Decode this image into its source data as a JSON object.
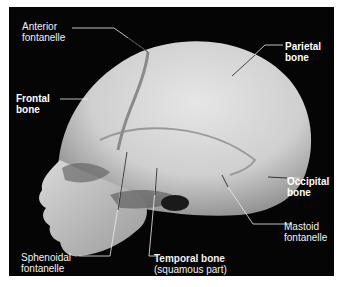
{
  "figure": {
    "background_color": "#050505",
    "bone_color": "#d8d8d8",
    "label_color": "#ffffff"
  },
  "labels": {
    "anterior_fontanelle": {
      "line1": "Anterior",
      "line2": "fontanelle"
    },
    "frontal_bone": {
      "line1": "Frontal",
      "line2": "bone"
    },
    "parietal_bone": {
      "line1": "Parietal",
      "line2": "bone"
    },
    "occipital_bone": {
      "line1": "Occipital",
      "line2": "bone"
    },
    "mastoid_fontanelle": {
      "line1": "Mastoid",
      "line2": "fontanelle"
    },
    "sphenoidal_fontanelle": {
      "line1": "Sphenoidal",
      "line2": "fontanelle"
    },
    "temporal_bone": {
      "line1": "Temporal bone",
      "line2": "(squamous part)"
    }
  }
}
